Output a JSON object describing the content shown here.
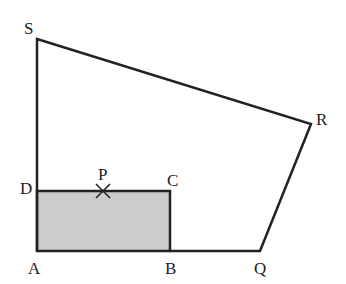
{
  "diagram": {
    "type": "geometry",
    "colors": {
      "stroke": "#222222",
      "shade": "#cccccc",
      "background": "#ffffff"
    },
    "points": {
      "S": {
        "label": "S",
        "x": 37,
        "y": 39
      },
      "R": {
        "label": "R",
        "x": 311,
        "y": 124
      },
      "Q": {
        "label": "Q",
        "x": 260,
        "y": 251
      },
      "A": {
        "label": "A",
        "x": 37,
        "y": 251
      },
      "B": {
        "label": "B",
        "x": 170,
        "y": 251
      },
      "C": {
        "label": "C",
        "x": 170,
        "y": 191
      },
      "D": {
        "label": "D",
        "x": 37,
        "y": 191
      },
      "P": {
        "label": "P",
        "x": 103,
        "y": 191
      }
    },
    "shaded_region": "ABCD",
    "marked_point": "P"
  }
}
